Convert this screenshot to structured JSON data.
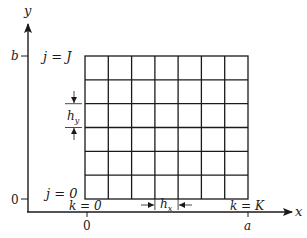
{
  "figure": {
    "axes": {
      "x_label": "x",
      "y_label": "y",
      "x_ticks": [
        {
          "label": "0",
          "x": 87
        },
        {
          "label": "a",
          "x": 248
        }
      ],
      "y_ticks": [
        {
          "label": "b",
          "y": 56
        },
        {
          "label": "0",
          "y": 199
        }
      ]
    },
    "grid": {
      "columns": 7,
      "rows": 6,
      "left": 85,
      "right": 248,
      "top": 56,
      "bottom": 199,
      "line_color": "#1a1a1a"
    },
    "labels": {
      "j_top": "j = J",
      "j_bottom": "j = 0",
      "k_left": "k = 0",
      "k_right": "k = K",
      "hx": "h",
      "hx_sub": "x",
      "hy": "h",
      "hy_sub": "y"
    }
  }
}
